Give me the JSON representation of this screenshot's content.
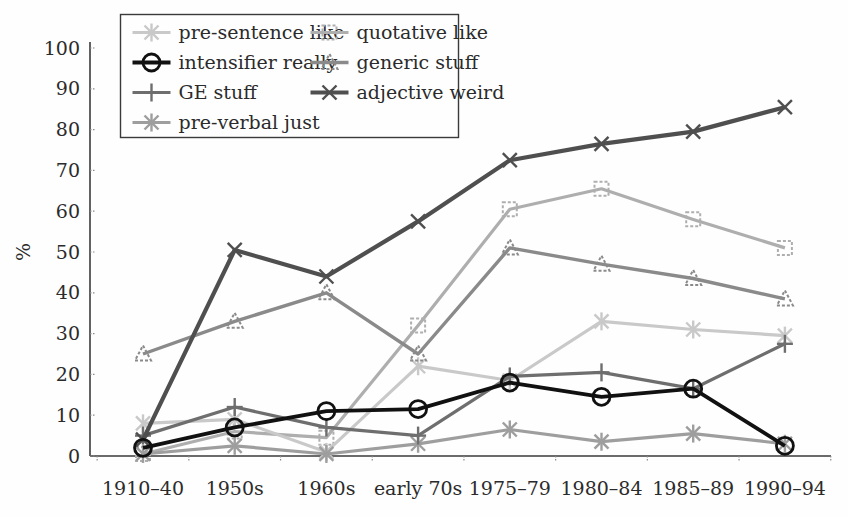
{
  "figure": {
    "background": "#fefefe",
    "text_color": "#2b2b2b",
    "axis_color": "#3a3a3a"
  },
  "chart_data": {
    "type": "line",
    "title": "",
    "xlabel": "",
    "ylabel": "%",
    "ylim": [
      0,
      100
    ],
    "y_ticks": [
      0,
      10,
      20,
      30,
      40,
      50,
      60,
      70,
      80,
      90,
      100
    ],
    "grid": false,
    "legend_position": "upper-left",
    "categories": [
      "1910–40",
      "1950s",
      "1960s",
      "early 70s",
      "1975–79",
      "1980–84",
      "1985–89",
      "1990–94"
    ],
    "series": [
      {
        "name": "pre-sentence like",
        "marker": "star6",
        "color": "#c9c9c9",
        "line_width": 3.2,
        "values": [
          8,
          9,
          1,
          22,
          18.5,
          33,
          31,
          29.5
        ]
      },
      {
        "name": "quotative like",
        "marker": "square-dashed",
        "color": "#aeaeae",
        "line_width": 3.2,
        "values": [
          0.5,
          6,
          4.5,
          32,
          60.5,
          65.5,
          58,
          51
        ]
      },
      {
        "name": "intensifier really",
        "marker": "circle",
        "color": "#111111",
        "line_width": 3.8,
        "values": [
          2,
          7,
          11,
          11.5,
          18,
          14.5,
          16.5,
          2.5
        ]
      },
      {
        "name": "generic stuff",
        "marker": "triangle-dashed",
        "color": "#8a8a8a",
        "line_width": 3.4,
        "values": [
          25,
          33,
          40,
          25,
          51,
          47,
          43.5,
          38.5
        ]
      },
      {
        "name": "GE stuff",
        "marker": "plus",
        "color": "#6e6e6e",
        "line_width": 3.2,
        "values": [
          5,
          12,
          7,
          5,
          19.5,
          20.5,
          16.5,
          27.5
        ]
      },
      {
        "name": "adjective weird",
        "marker": "x",
        "color": "#4f4f4f",
        "line_width": 4.2,
        "values": [
          4,
          50.5,
          44,
          57.5,
          72.5,
          76.5,
          79.5,
          85.5
        ]
      },
      {
        "name": "pre-verbal just",
        "marker": "asterisk",
        "color": "#9e9e9e",
        "line_width": 3.2,
        "values": [
          0.5,
          2.5,
          0.5,
          3,
          6.5,
          3.5,
          5.5,
          3
        ]
      }
    ]
  },
  "legend": {
    "columns": [
      [
        "pre-sentence like",
        "intensifier really",
        "GE stuff",
        "pre-verbal just"
      ],
      [
        "quotative like",
        "generic stuff",
        "adjective weird"
      ]
    ]
  }
}
